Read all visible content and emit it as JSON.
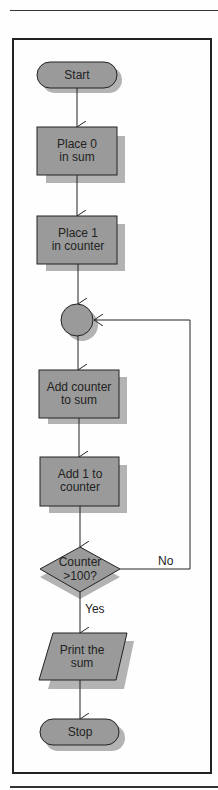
{
  "colors": {
    "node_fill": "#9a9a9a",
    "shadow_fill": "#b3b3b3",
    "stroke": "#222222",
    "background": "#fefefe"
  },
  "nodes": {
    "start": {
      "type": "terminal",
      "lines": [
        "Start"
      ]
    },
    "place_sum": {
      "type": "process",
      "lines": [
        "Place 0",
        "in sum"
      ]
    },
    "place_counter": {
      "type": "process",
      "lines": [
        "Place 1",
        "in counter"
      ]
    },
    "connector": {
      "type": "connector",
      "lines": []
    },
    "add_counter": {
      "type": "process",
      "lines": [
        "Add counter",
        "to sum"
      ]
    },
    "add_one": {
      "type": "process",
      "lines": [
        "Add 1 to",
        "counter"
      ]
    },
    "decision": {
      "type": "decision",
      "lines": [
        "Counter",
        ">100?"
      ]
    },
    "print": {
      "type": "io",
      "lines": [
        "Print the",
        "sum"
      ]
    },
    "stop": {
      "type": "terminal",
      "lines": [
        "Stop"
      ]
    }
  },
  "edges": {
    "no_label": "No",
    "yes_label": "Yes"
  }
}
